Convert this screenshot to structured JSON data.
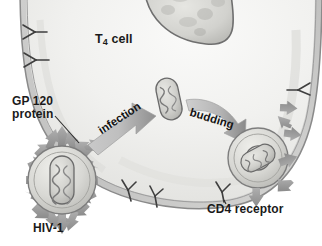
{
  "figure": {
    "background_color": "#ffffff",
    "width": 322,
    "height": 246
  },
  "labels": {
    "t4_cell": "T",
    "t4_cell_subscript": "4",
    "t4_cell_suffix": " cell",
    "gp120_line1": "GP 120",
    "gp120_line2": "protein",
    "hiv1": "HIV-1",
    "cd4_receptor": "CD4 receptor"
  },
  "process_arrows": {
    "infection": "infection",
    "budding": "budding"
  },
  "colors": {
    "cell_cytoplasm": "#f2f2f0",
    "cell_membrane": "#8d8d8d",
    "nucleus_fill": "#d8d8d4",
    "nucleus_outline": "#6f6f6f",
    "virion_envelope": "#d6d6d2",
    "virion_outline": "#7d7d7d",
    "capsid_fill": "#cfcfcb",
    "capsid_outline": "#6a6a6a",
    "spike_arrow": "#9a9a9a",
    "process_arrow_light": "#d3d3d3",
    "process_arrow_dark": "#8e8e8e",
    "receptor_stroke": "#4a4a4a",
    "label_text": "#1a1a1a"
  },
  "elements": {
    "nucleus_name": "nucleus",
    "hiv1_virion_name": "hiv1-virion",
    "internal_capsid_name": "internal-viral-capsid",
    "budding_virion_name": "budding-virion",
    "receptor_count_left": 2,
    "receptor_count_bottom": 2,
    "receptor_count_right": 1,
    "receptor_count_near_budding": 1,
    "spike_count": 17
  }
}
